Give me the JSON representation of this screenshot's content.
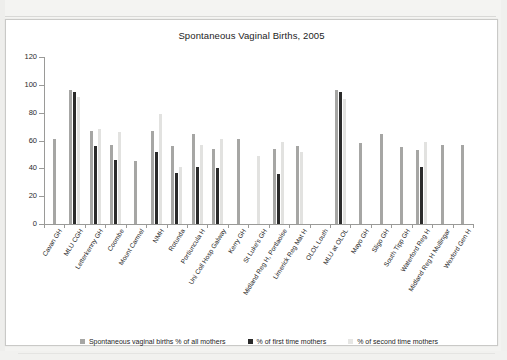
{
  "chart_data": {
    "type": "bar",
    "title": "Spontaneous Vaginal Births, 2005",
    "xlabel": "",
    "ylabel": "",
    "ylim": [
      0,
      120
    ],
    "yticks": [
      0,
      20,
      40,
      60,
      80,
      100,
      120
    ],
    "grid": false,
    "legend_position": "bottom",
    "categories": [
      "Cavan GH",
      "MLU CGH",
      "Letterkenny GH",
      "Coombe",
      "Mount Carmel",
      "NMH",
      "Rotunda",
      "Portiuncula H",
      "Uni Coll Hosp Galway",
      "Kerry GH",
      "St Luke's GH",
      "Midland Reg H, Portlaoise",
      "Limerick Reg Mat H",
      "OLOL Louth",
      "MLU at OLOL",
      "Mayo GH",
      "Sligo GH",
      "South Tipp GH",
      "Waterford Reg H",
      "Midland Reg H Mullingar",
      "Wexford Gen H"
    ],
    "series": [
      {
        "name": "Spontaneous vaginal births % of all mothers",
        "color": "#a6a6a4",
        "values": [
          61,
          96,
          67,
          57,
          45,
          67,
          56,
          65,
          54,
          61,
          null,
          54,
          56,
          null,
          96,
          58,
          65,
          55,
          53,
          57,
          57
        ]
      },
      {
        "name": "% of first time mothers",
        "color": "#2b2b2b",
        "values": [
          null,
          95,
          56,
          46,
          null,
          52,
          37,
          41,
          40,
          null,
          null,
          36,
          null,
          null,
          95,
          null,
          null,
          null,
          41,
          null,
          null
        ]
      },
      {
        "name": "% of second time mothers",
        "color": "#e2e2e0",
        "values": [
          null,
          91,
          68,
          66,
          null,
          79,
          41,
          57,
          61,
          null,
          49,
          59,
          52,
          null,
          90,
          null,
          null,
          null,
          59,
          null,
          null
        ]
      }
    ],
    "present_bars": [
      [
        1,
        0,
        0
      ],
      [
        1,
        1,
        1
      ],
      [
        1,
        1,
        1
      ],
      [
        1,
        1,
        1
      ],
      [
        1,
        0,
        0
      ],
      [
        1,
        1,
        1
      ],
      [
        1,
        1,
        1
      ],
      [
        1,
        1,
        1
      ],
      [
        1,
        1,
        1
      ],
      [
        1,
        0,
        0
      ],
      [
        0,
        0,
        1
      ],
      [
        1,
        1,
        1
      ],
      [
        1,
        0,
        1
      ],
      [
        1,
        0,
        0
      ],
      [
        1,
        1,
        1
      ],
      [
        1,
        0,
        0
      ],
      [
        1,
        0,
        0
      ],
      [
        1,
        0,
        0
      ],
      [
        1,
        1,
        1
      ],
      [
        1,
        0,
        0
      ],
      [
        1,
        0,
        0
      ]
    ]
  },
  "legend": {
    "items": [
      "Spontaneous vaginal births % of all mothers",
      "% of first time mothers",
      "% of second time mothers"
    ]
  },
  "colors": {
    "series_all_mothers": "#a6a6a4",
    "series_first_time": "#2b2b2b",
    "series_second_time": "#e2e2e0",
    "axis": "#9a9a98",
    "page": "#ffffff"
  }
}
